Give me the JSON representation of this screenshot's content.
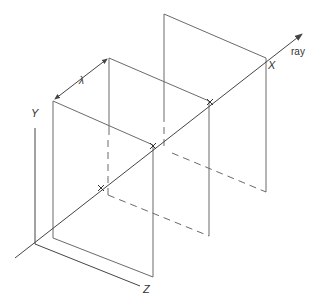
{
  "diagram": {
    "labels": {
      "y_axis": "Y",
      "z_axis": "Z",
      "x_axis": "X",
      "ray": "ray",
      "wavelength": "λ"
    },
    "colors": {
      "line": "#6a6a6a",
      "text": "#333333",
      "background": "#ffffff"
    }
  }
}
